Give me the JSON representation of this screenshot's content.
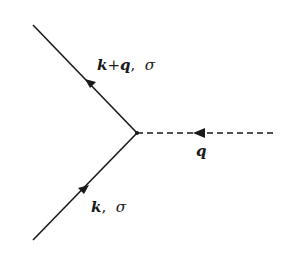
{
  "diagram": {
    "type": "feynman-vertex",
    "colors": {
      "line": "#1a1a1a",
      "background": "#ffffff"
    },
    "vertex": {
      "x": 137,
      "y": 133
    },
    "lines": [
      {
        "id": "incoming-fermion",
        "style": "solid",
        "from": [
          33,
          240
        ],
        "to": [
          137,
          133
        ],
        "arrow": "toward-vertex"
      },
      {
        "id": "outgoing-fermion",
        "style": "solid",
        "from": [
          137,
          133
        ],
        "to": [
          33,
          25
        ],
        "arrow": "away-from-vertex"
      },
      {
        "id": "boson",
        "style": "dashed",
        "from": [
          276,
          133
        ],
        "to": [
          137,
          133
        ],
        "arrow": "toward-vertex"
      }
    ],
    "labels": {
      "outgoing": {
        "momentum_k": "k",
        "plus": "+",
        "momentum_q": "q",
        "comma": ",",
        "spin": "σ"
      },
      "boson": {
        "momentum": "q"
      },
      "incoming": {
        "momentum": "k",
        "comma": ",",
        "spin": "σ"
      }
    }
  }
}
